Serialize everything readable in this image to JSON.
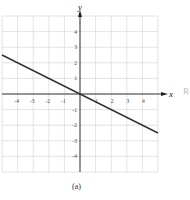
{
  "chart_data": {
    "type": "line",
    "title": "",
    "xlabel": "x",
    "ylabel": "y",
    "xlim": [
      -5,
      5
    ],
    "ylim": [
      -5,
      5
    ],
    "xticks": [
      -4,
      -3,
      -2,
      -1,
      1,
      2,
      3,
      4
    ],
    "yticks": [
      -4,
      -3,
      -2,
      -1,
      1,
      2,
      3,
      4
    ],
    "grid": true,
    "series": [
      {
        "name": "line",
        "equation": "y = -0.5x",
        "x": [
          -5,
          5
        ],
        "y": [
          2.5,
          -2.5
        ]
      }
    ]
  },
  "caption": "(a)",
  "side_label": "R",
  "colors": {
    "grid": "#dcdcdc",
    "axis": "#222222",
    "line": "#333333"
  }
}
